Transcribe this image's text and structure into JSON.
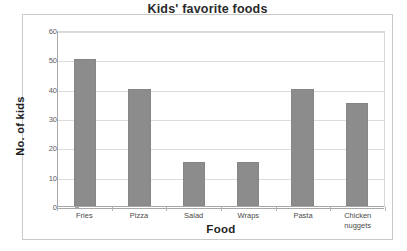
{
  "chart_data": {
    "type": "bar",
    "title": "Kids' favorite foods",
    "xlabel": "Food",
    "ylabel": "No. of kids",
    "categories": [
      "Fries",
      "Pizza",
      "Salad",
      "Wraps",
      "Pasta",
      "Chicken nuggets"
    ],
    "values": [
      50,
      40,
      15,
      15,
      40,
      35
    ],
    "ylim": [
      0,
      60
    ],
    "yticks": [
      0,
      10,
      20,
      30,
      40,
      50,
      60
    ],
    "ytick_labels": [
      "0",
      "10",
      "20",
      "30",
      "40",
      "50",
      "60"
    ],
    "grid": true,
    "legend": false,
    "legend_position": "none",
    "bar_color": "#8c8c8c",
    "gridline_color": "#dcdcdc",
    "axis_color": "#a8a8a8",
    "title_color": "#2b2b2b",
    "background_color": "#ffffff"
  }
}
